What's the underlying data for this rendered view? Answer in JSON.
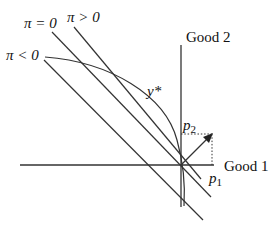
{
  "diagram": {
    "axes": {
      "x_label": "Good 1",
      "y_label": "Good 2"
    },
    "isoprofit_lines": [
      {
        "label": "π > 0"
      },
      {
        "label": "π = 0"
      },
      {
        "label": "π < 0"
      }
    ],
    "production_frontier": {
      "label": "y*"
    },
    "price_vector": {
      "p1_label": "p",
      "p1_sub": "1",
      "p2_label": "p",
      "p2_sub": "2"
    },
    "colors": {
      "line": "#222222",
      "background": "#ffffff"
    }
  }
}
